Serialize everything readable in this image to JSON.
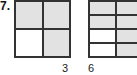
{
  "problem": {
    "number": "7.",
    "figures": [
      {
        "name": "fraction-model-a",
        "rows": 2,
        "cols": 2,
        "cells": [
          [
            "shaded",
            "shaded"
          ],
          [
            "white",
            "shaded"
          ]
        ],
        "label": "3"
      },
      {
        "name": "fraction-model-b",
        "rows": 4,
        "cols": 2,
        "cells": [
          [
            "shaded",
            "shaded"
          ],
          [
            "shaded",
            "shaded"
          ],
          [
            "white",
            "shaded"
          ],
          [
            "white",
            "shaded"
          ]
        ],
        "label": "6"
      }
    ],
    "colors": {
      "shaded": "#e2e2e2",
      "line": "#333333"
    }
  }
}
